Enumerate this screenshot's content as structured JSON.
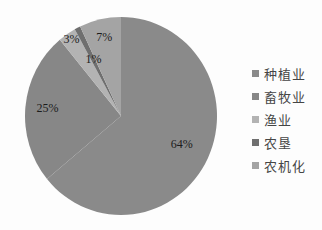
{
  "chart_data": {
    "type": "pie",
    "title": "",
    "labels": [
      "种植业",
      "畜牧业",
      "渔业",
      "农垦",
      "农机化"
    ],
    "values": [
      64,
      25,
      3,
      1,
      7
    ],
    "percent_labels": [
      "64%",
      "25%",
      "3%",
      "1%",
      "7%"
    ],
    "colors": [
      "#8a8a8a",
      "#878787",
      "#b3b3b3",
      "#6f6f6f",
      "#a4a4a4"
    ],
    "start_angle_deg": 0,
    "direction": "clockwise",
    "legend_position": "right",
    "label_radius_fraction": [
      0.7,
      0.77,
      0.92,
      0.63,
      0.8
    ],
    "label_color": "#1c1c1c",
    "legend_text_color": "#454545",
    "background_color": "#fdfdfd"
  }
}
